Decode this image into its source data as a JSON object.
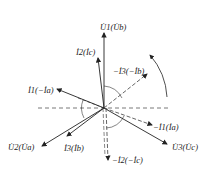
{
  "diagram": {
    "type": "phasor-diagram",
    "origin": {
      "x": 104,
      "y": 108
    },
    "colors": {
      "line": "#222222",
      "dashed": "#555555",
      "background": "#ffffff"
    },
    "vectors": [
      {
        "id": "U1",
        "label": "U̇1(U̇b)",
        "style": "solid",
        "x2": 104,
        "y2": 33,
        "label_x": 100,
        "label_y": 30
      },
      {
        "id": "I2",
        "label": "İ2(İc)",
        "style": "solid",
        "x2": 98,
        "y2": 58,
        "label_x": 76,
        "label_y": 55
      },
      {
        "id": "negI3",
        "label": "−İ3(−İb)",
        "style": "dashed",
        "x2": 147,
        "y2": 74,
        "label_x": 113,
        "label_y": 74
      },
      {
        "id": "I1",
        "label": "İ1(−İa)",
        "style": "solid",
        "x2": 57,
        "y2": 89,
        "label_x": 28,
        "label_y": 93
      },
      {
        "id": "negI1",
        "label": "−İ1(İa)",
        "style": "dashed",
        "x2": 152,
        "y2": 125,
        "label_x": 153,
        "label_y": 130
      },
      {
        "id": "U2",
        "label": "U̇2(U̇a)",
        "style": "solid",
        "x2": 42,
        "y2": 146,
        "label_x": 8,
        "label_y": 150
      },
      {
        "id": "I3",
        "label": "İ3(İb)",
        "style": "solid",
        "x2": 67,
        "y2": 136,
        "label_x": 64,
        "label_y": 151
      },
      {
        "id": "U3",
        "label": "U̇3(U̇c)",
        "style": "solid",
        "x2": 167,
        "y2": 144,
        "label_x": 172,
        "label_y": 150
      },
      {
        "id": "negI2",
        "label": "−İ2(−İc)",
        "style": "dashed",
        "x2": 108,
        "y2": 160,
        "label_x": 112,
        "label_y": 163
      }
    ],
    "axis": {
      "label": "horizontal-reference",
      "x1": 38,
      "x2": 170,
      "y": 108
    },
    "rotation_arrow": {
      "direction": "counterclockwise"
    }
  }
}
